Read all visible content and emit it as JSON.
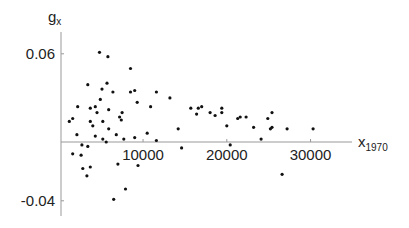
{
  "chart_data": {
    "type": "scatter",
    "title": "",
    "xlabel": "x",
    "xlabel_subscript": "1970",
    "ylabel": "g",
    "ylabel_subscript": "x",
    "xlim": [
      -100,
      34500
    ],
    "ylim": [
      -0.05,
      0.075
    ],
    "x_ticks": [
      10000,
      20000,
      30000
    ],
    "x_tick_labels": [
      "10000",
      "20000",
      "30000"
    ],
    "y_ticks": [
      0.06,
      -0.04
    ],
    "y_tick_labels": [
      "0.06",
      "-0.04"
    ],
    "grid": false,
    "legend": null,
    "marker_color": "#111111",
    "axis_color": "#999999",
    "points": [
      [
        4800,
        0.061
      ],
      [
        5800,
        0.058
      ],
      [
        3400,
        0.039
      ],
      [
        5700,
        0.04
      ],
      [
        5100,
        0.036
      ],
      [
        6400,
        0.034
      ],
      [
        4900,
        0.029
      ],
      [
        2200,
        0.024
      ],
      [
        3700,
        0.023
      ],
      [
        4300,
        0.024
      ],
      [
        5900,
        0.022
      ],
      [
        4500,
        0.02
      ],
      [
        1600,
        0.016
      ],
      [
        1200,
        0.014
      ],
      [
        3700,
        0.014
      ],
      [
        5200,
        0.014
      ],
      [
        4000,
        0.011
      ],
      [
        5900,
        0.009
      ],
      [
        2100,
        0.005
      ],
      [
        4300,
        0.004
      ],
      [
        5200,
        0.002
      ],
      [
        5600,
        0.0
      ],
      [
        2700,
        -0.002
      ],
      [
        3400,
        -0.003
      ],
      [
        1600,
        -0.008
      ],
      [
        2600,
        -0.009
      ],
      [
        2800,
        -0.018
      ],
      [
        3700,
        -0.017
      ],
      [
        3300,
        -0.023
      ],
      [
        7000,
        -0.015
      ],
      [
        9400,
        -0.016
      ],
      [
        7900,
        -0.032
      ],
      [
        6500,
        -0.039
      ],
      [
        11600,
        0.001
      ],
      [
        8500,
        0.05
      ],
      [
        8500,
        0.034
      ],
      [
        9000,
        0.035
      ],
      [
        11600,
        0.034
      ],
      [
        13200,
        0.03
      ],
      [
        9300,
        0.027
      ],
      [
        10900,
        0.024
      ],
      [
        7500,
        0.02
      ],
      [
        7200,
        0.017
      ],
      [
        7400,
        0.015
      ],
      [
        14200,
        0.009
      ],
      [
        6800,
        0.005
      ],
      [
        10500,
        0.006
      ],
      [
        7700,
        0.002
      ],
      [
        9000,
        0.003
      ],
      [
        15700,
        0.023
      ],
      [
        16600,
        0.023
      ],
      [
        17000,
        0.024
      ],
      [
        16400,
        0.019
      ],
      [
        19400,
        0.023
      ],
      [
        19400,
        0.02
      ],
      [
        18000,
        0.02
      ],
      [
        18600,
        0.018
      ],
      [
        20000,
        0.011
      ],
      [
        21300,
        0.016
      ],
      [
        21600,
        0.017
      ],
      [
        22300,
        0.017
      ],
      [
        14600,
        -0.004
      ],
      [
        20400,
        -0.002
      ],
      [
        25400,
        0.02
      ],
      [
        24900,
        0.016
      ],
      [
        23200,
        0.01
      ],
      [
        25400,
        0.01
      ],
      [
        25200,
        0.009
      ],
      [
        27200,
        0.009
      ],
      [
        30300,
        0.009
      ],
      [
        24100,
        0.002
      ],
      [
        26600,
        -0.022
      ]
    ]
  }
}
